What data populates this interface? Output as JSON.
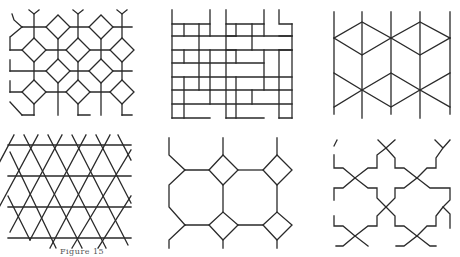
{
  "figure": {
    "caption": "Figure 15",
    "line_color": "#2a2a2a",
    "background": "#ffffff",
    "panels": [
      {
        "id": "p1",
        "label": "octagon-square tiling with diamonds",
        "position": "top-left"
      },
      {
        "id": "p2",
        "label": "basketweave brick pattern",
        "position": "top-middle"
      },
      {
        "id": "p3",
        "label": "isometric cube / rhombus pattern",
        "position": "top-right"
      },
      {
        "id": "p4",
        "label": "trihexagonal (star of David) lattice",
        "position": "bottom-left"
      },
      {
        "id": "p5",
        "label": "octagons and squares",
        "position": "bottom-middle"
      },
      {
        "id": "p6",
        "label": "interlocking cross / stepped star pattern",
        "position": "bottom-right"
      }
    ]
  }
}
